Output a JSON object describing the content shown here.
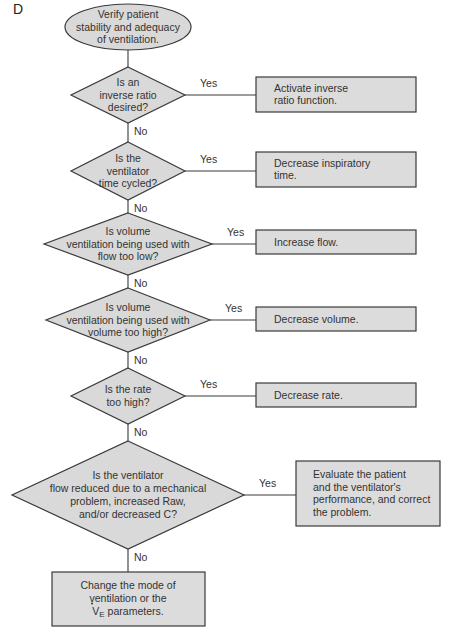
{
  "panel_label": "D",
  "start": {
    "lines": [
      "Verify patient",
      "stability and adequacy",
      "of ventilation."
    ]
  },
  "decisions": [
    {
      "lines": [
        "Is an",
        "inverse ratio",
        "desired?"
      ],
      "yes": "Yes",
      "no": "No",
      "action": [
        "Activate inverse",
        "ratio function."
      ]
    },
    {
      "lines": [
        "Is the",
        "ventilator",
        "time cycled?"
      ],
      "yes": "Yes",
      "no": "No",
      "action": [
        "Decrease inspiratory",
        "time."
      ]
    },
    {
      "lines": [
        "Is volume",
        "ventilation being used with",
        "flow too low?"
      ],
      "yes": "Yes",
      "no": "No",
      "action": [
        "Increase flow."
      ]
    },
    {
      "lines": [
        "Is volume",
        "ventilation being used with",
        "volume too high?"
      ],
      "yes": "Yes",
      "no": "No",
      "action": [
        "Decrease volume."
      ]
    },
    {
      "lines": [
        "Is the rate",
        "too high?"
      ],
      "yes": "Yes",
      "no": "No",
      "action": [
        "Decrease rate."
      ]
    },
    {
      "lines": [
        "Is the ventilator",
        "flow reduced due to a mechanical",
        "problem, increased Raw,",
        "and/or decreased C?"
      ],
      "yes": "Yes",
      "no": "No",
      "action": [
        "Evaluate the patient",
        "and the ventilator's",
        "performance, and correct",
        "the problem."
      ]
    }
  ],
  "end": {
    "lines": [
      "Change the mode of",
      "ventilation or the",
      "parameters."
    ],
    "symbol": "V",
    "subscript": "E"
  },
  "colors": {
    "fill": "#d9d9d9",
    "stroke": "#3a3a3a",
    "text": "#333333"
  }
}
